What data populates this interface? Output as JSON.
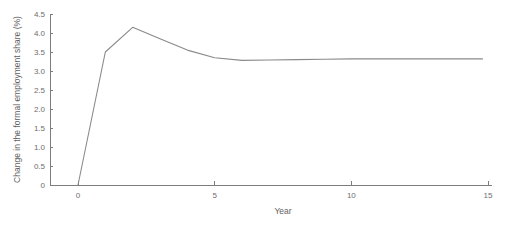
{
  "chart_data": {
    "type": "line",
    "title": "",
    "xlabel": "Year",
    "ylabel": "Change in the formal employment share (%)",
    "xlim": [
      -0.6,
      15
    ],
    "ylim": [
      0,
      4.5
    ],
    "grid": false,
    "legend": null,
    "line_color": "#8a8a8a",
    "axis_color": "#7d7d7d",
    "x": [
      0,
      1,
      2,
      3,
      4,
      5,
      6,
      7,
      8,
      9,
      10,
      11,
      12,
      13,
      14,
      14.8
    ],
    "values": [
      0,
      3.5,
      4.15,
      3.85,
      3.55,
      3.35,
      3.28,
      3.29,
      3.3,
      3.31,
      3.32,
      3.32,
      3.32,
      3.32,
      3.32,
      3.32
    ],
    "series": [
      {
        "name": "Change in the formal employment share",
        "values": [
          0,
          3.5,
          4.15,
          3.85,
          3.55,
          3.35,
          3.28,
          3.29,
          3.3,
          3.31,
          3.32,
          3.32,
          3.32,
          3.32,
          3.32,
          3.32
        ]
      }
    ],
    "xticks": [
      {
        "value": 0,
        "label": "0"
      },
      {
        "value": 5,
        "label": "5"
      },
      {
        "value": 10,
        "label": "10"
      },
      {
        "value": 15,
        "label": "15"
      }
    ],
    "yticks": [
      {
        "value": 0,
        "label": "0"
      },
      {
        "value": 0.5,
        "label": "0.5"
      },
      {
        "value": 1,
        "label": "1.0"
      },
      {
        "value": 1.5,
        "label": "1.5"
      },
      {
        "value": 2,
        "label": "2.0"
      },
      {
        "value": 2.5,
        "label": "2.5"
      },
      {
        "value": 3,
        "label": "3.0"
      },
      {
        "value": 3.5,
        "label": "3.5"
      },
      {
        "value": 4,
        "label": "4.0"
      },
      {
        "value": 4.5,
        "label": "4.5"
      }
    ]
  }
}
